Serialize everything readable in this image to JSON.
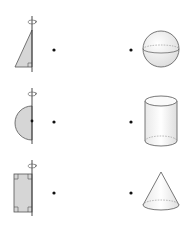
{
  "colors": {
    "stroke": "#555555",
    "axis": "#333333",
    "fill": "#d6d6d6",
    "solid_fill": "#f4f4f4",
    "dot": "#111111",
    "background": "#ffffff"
  },
  "left_column": {
    "label": "Plane figures rotated about an axis",
    "items": [
      {
        "id": "right-triangle",
        "name": "Right triangle rotated about its vertical leg",
        "dot": {
          "x": 54,
          "y": 50
        }
      },
      {
        "id": "semicircle",
        "name": "Semicircle rotated about its diameter",
        "dot": {
          "x": 54,
          "y": 122
        }
      },
      {
        "id": "rectangle",
        "name": "Rectangle rotated about one side",
        "dot": {
          "x": 54,
          "y": 193
        }
      }
    ]
  },
  "right_column": {
    "label": "Solids of revolution",
    "items": [
      {
        "id": "sphere",
        "name": "Sphere",
        "dot": {
          "x": 131,
          "y": 50
        }
      },
      {
        "id": "cylinder",
        "name": "Cylinder",
        "dot": {
          "x": 131,
          "y": 122
        }
      },
      {
        "id": "cone",
        "name": "Cone",
        "dot": {
          "x": 131,
          "y": 193
        }
      }
    ]
  },
  "icons": {
    "rotation_arrow": "rotation-arrow-icon"
  }
}
